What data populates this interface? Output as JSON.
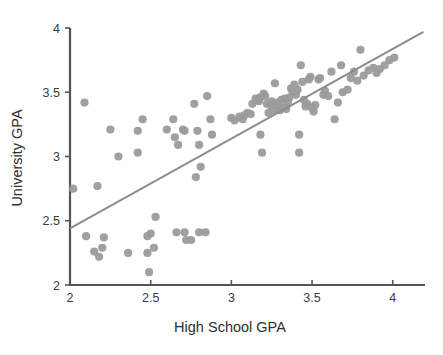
{
  "chart_data": {
    "type": "scatter",
    "title": "",
    "xlabel": "High School GPA",
    "ylabel": "University GPA",
    "xlim": [
      2,
      4.2
    ],
    "ylim": [
      2,
      4
    ],
    "xticks": [
      2,
      2.5,
      3,
      3.5,
      4
    ],
    "xticklabels": [
      "2",
      "2.5",
      "3",
      "3.5",
      "4"
    ],
    "yticks": [
      2,
      2.5,
      3,
      3.5,
      4
    ],
    "yticklabels": [
      "2",
      "2.5",
      "3",
      "3.5",
      "4"
    ],
    "grid": false,
    "legend": null,
    "marker_color": "#9b9b9b",
    "line_color": "#8c8c8c",
    "axis_color": "#555555",
    "series": [
      {
        "name": "students",
        "type": "scatter",
        "points": [
          [
            2.02,
            2.75
          ],
          [
            2.09,
            3.42
          ],
          [
            2.1,
            2.38
          ],
          [
            2.15,
            2.26
          ],
          [
            2.17,
            2.77
          ],
          [
            2.18,
            2.22
          ],
          [
            2.2,
            2.29
          ],
          [
            2.21,
            2.37
          ],
          [
            2.25,
            3.21
          ],
          [
            2.3,
            3.0
          ],
          [
            2.36,
            2.25
          ],
          [
            2.42,
            3.03
          ],
          [
            2.42,
            3.2
          ],
          [
            2.45,
            3.29
          ],
          [
            2.48,
            2.25
          ],
          [
            2.48,
            2.38
          ],
          [
            2.49,
            2.1
          ],
          [
            2.5,
            2.4
          ],
          [
            2.52,
            2.29
          ],
          [
            2.53,
            2.53
          ],
          [
            2.6,
            3.21
          ],
          [
            2.64,
            3.29
          ],
          [
            2.65,
            3.15
          ],
          [
            2.66,
            2.41
          ],
          [
            2.67,
            3.09
          ],
          [
            2.7,
            3.21
          ],
          [
            2.71,
            3.2
          ],
          [
            2.71,
            2.41
          ],
          [
            2.72,
            2.35
          ],
          [
            2.75,
            2.35
          ],
          [
            2.77,
            3.41
          ],
          [
            2.78,
            2.84
          ],
          [
            2.79,
            3.2
          ],
          [
            2.8,
            3.09
          ],
          [
            2.8,
            2.41
          ],
          [
            2.81,
            2.92
          ],
          [
            2.84,
            2.41
          ],
          [
            2.85,
            3.47
          ],
          [
            2.87,
            3.29
          ],
          [
            2.88,
            3.17
          ],
          [
            3.0,
            3.3
          ],
          [
            3.02,
            3.28
          ],
          [
            3.05,
            3.31
          ],
          [
            3.07,
            3.29
          ],
          [
            3.08,
            3.32
          ],
          [
            3.1,
            3.34
          ],
          [
            3.12,
            3.33
          ],
          [
            3.13,
            3.41
          ],
          [
            3.15,
            3.45
          ],
          [
            3.16,
            3.44
          ],
          [
            3.17,
            3.43
          ],
          [
            3.18,
            3.46
          ],
          [
            3.18,
            3.17
          ],
          [
            3.19,
            3.03
          ],
          [
            3.2,
            3.49
          ],
          [
            3.21,
            3.47
          ],
          [
            3.22,
            3.41
          ],
          [
            3.23,
            3.34
          ],
          [
            3.24,
            3.4
          ],
          [
            3.25,
            3.43
          ],
          [
            3.26,
            3.36
          ],
          [
            3.27,
            3.57
          ],
          [
            3.28,
            3.42
          ],
          [
            3.29,
            3.39
          ],
          [
            3.3,
            3.36
          ],
          [
            3.31,
            3.44
          ],
          [
            3.32,
            3.38
          ],
          [
            3.33,
            3.45
          ],
          [
            3.34,
            3.37
          ],
          [
            3.35,
            3.42
          ],
          [
            3.36,
            3.46
          ],
          [
            3.37,
            3.53
          ],
          [
            3.38,
            3.5
          ],
          [
            3.39,
            3.56
          ],
          [
            3.4,
            3.48
          ],
          [
            3.41,
            3.52
          ],
          [
            3.42,
            3.17
          ],
          [
            3.42,
            3.03
          ],
          [
            3.43,
            3.71
          ],
          [
            3.44,
            3.58
          ],
          [
            3.45,
            3.44
          ],
          [
            3.46,
            3.39
          ],
          [
            3.47,
            3.41
          ],
          [
            3.48,
            3.6
          ],
          [
            3.49,
            3.62
          ],
          [
            3.5,
            3.38
          ],
          [
            3.51,
            3.35
          ],
          [
            3.52,
            3.4
          ],
          [
            3.54,
            3.6
          ],
          [
            3.55,
            3.61
          ],
          [
            3.57,
            3.48
          ],
          [
            3.58,
            3.51
          ],
          [
            3.6,
            3.47
          ],
          [
            3.62,
            3.66
          ],
          [
            3.64,
            3.29
          ],
          [
            3.66,
            3.42
          ],
          [
            3.68,
            3.71
          ],
          [
            3.69,
            3.5
          ],
          [
            3.72,
            3.52
          ],
          [
            3.74,
            3.61
          ],
          [
            3.76,
            3.66
          ],
          [
            3.78,
            3.59
          ],
          [
            3.8,
            3.83
          ],
          [
            3.82,
            3.63
          ],
          [
            3.85,
            3.67
          ],
          [
            3.88,
            3.69
          ],
          [
            3.9,
            3.65
          ],
          [
            3.92,
            3.68
          ],
          [
            3.95,
            3.71
          ],
          [
            3.98,
            3.75
          ],
          [
            4.01,
            3.77
          ]
        ]
      },
      {
        "name": "regression-line",
        "type": "line",
        "x0": 2.0,
        "y0": 2.44,
        "x1": 4.19,
        "y1": 3.97
      }
    ]
  },
  "axes": {
    "x_axis_name": "x-axis",
    "y_axis_name": "y-axis"
  }
}
